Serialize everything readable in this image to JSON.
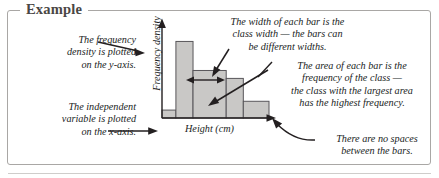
{
  "frame": {
    "legend": "Example"
  },
  "notes": {
    "y_density": "The frequency\ndensity is plotted\non the y-axis.",
    "x_independent": "The independent\nvariable is plotted\non the x-axis.",
    "bar_width": "The width of each bar is the\nclass width — the bars can\nbe different widths.",
    "bar_area": "The area of each bar is the\nfrequency of the class —\nthe class with the largest area\nhas the highest frequency.",
    "no_spaces": "There are no spaces\nbetween the bars."
  },
  "icons": {
    "y_axis_arrow": "up-arrow-icon",
    "x_axis_arrow": "right-arrow-icon",
    "width_double_arrow": "double-headed-arrow-icon",
    "pointer_density": "arrow-pointer-icon",
    "pointer_independent": "arrow-pointer-icon",
    "pointer_width": "arrow-pointer-icon",
    "pointer_area": "arrow-pointer-icon",
    "pointer_nospaces": "curved-arrow-pointer-icon"
  },
  "colors": {
    "bar_fill": "#c9c8c6",
    "bar_stroke": "#58565a",
    "axis": "#231f20",
    "frame_border": "#a9a7a5",
    "legend_text": "#4a4745",
    "body_text": "#201d1c"
  },
  "chart_data": {
    "type": "bar",
    "title": "",
    "subtitle": "",
    "xlabel": "Height (cm)",
    "ylabel": "Frequency density",
    "grid": false,
    "legend_position": "none",
    "xtick_labels": [],
    "ytick_labels": [],
    "xlim": [
      0,
      5
    ],
    "ylim": [
      0,
      5
    ],
    "note": "Histogram with unequal class widths; bars drawn contiguously with no gaps.",
    "bars": [
      {
        "label": "class-1",
        "x_start": 0.0,
        "x_end": 0.65,
        "class_width": 0.65,
        "frequency_density": 0.45
      },
      {
        "label": "class-2",
        "x_start": 0.65,
        "x_end": 1.45,
        "class_width": 0.8,
        "frequency_density": 4.35
      },
      {
        "label": "class-3",
        "x_start": 1.45,
        "x_end": 3.0,
        "class_width": 1.55,
        "frequency_density": 2.7
      },
      {
        "label": "class-4",
        "x_start": 3.0,
        "x_end": 3.8,
        "class_width": 0.8,
        "frequency_density": 2.25
      },
      {
        "label": "class-5",
        "x_start": 3.8,
        "x_end": 5.0,
        "class_width": 1.2,
        "frequency_density": 0.95
      }
    ]
  }
}
